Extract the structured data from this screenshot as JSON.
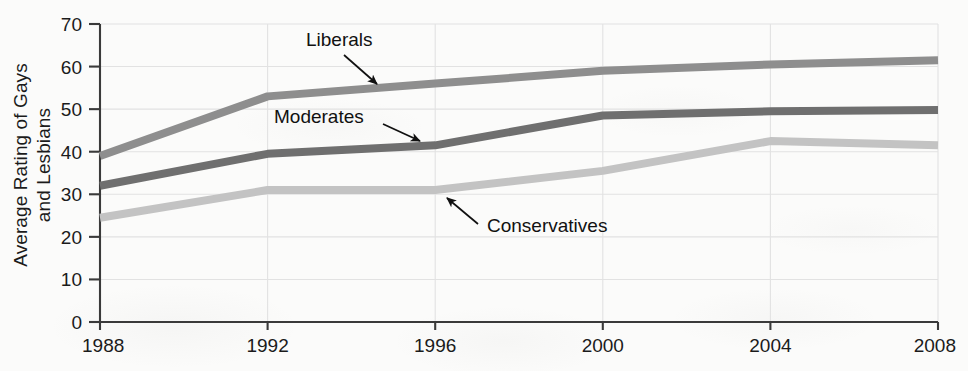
{
  "chart_data": {
    "type": "line",
    "title": "",
    "xlabel": "",
    "ylabel": "Average Rating of Gays and Lesbians",
    "ylabel_line1": "Average Rating of Gays",
    "ylabel_line2": "and Lesbians",
    "x": [
      1988,
      1992,
      1996,
      2000,
      2004,
      2008
    ],
    "categories": [
      "1988",
      "1992",
      "1996",
      "2000",
      "2004",
      "2008"
    ],
    "xlim": [
      1988,
      2008
    ],
    "ylim": [
      0,
      70
    ],
    "yticks": [
      0,
      10,
      20,
      30,
      40,
      50,
      60,
      70
    ],
    "ytick_labels": [
      "0",
      "10",
      "20",
      "30",
      "40",
      "50",
      "60",
      "70"
    ],
    "xticks": [
      1988,
      1992,
      1996,
      2000,
      2004,
      2008
    ],
    "xtick_labels": [
      "1988",
      "1992",
      "1996",
      "2000",
      "2004",
      "2008"
    ],
    "grid": true,
    "grid_axis": "both",
    "legend_position": "inline-annotations",
    "series": [
      {
        "name": "Liberals",
        "color": "#8e8e8e",
        "values": [
          39,
          53,
          56,
          59,
          60.5,
          61.5
        ]
      },
      {
        "name": "Moderates",
        "color": "#6f6f6f",
        "values": [
          32,
          39.5,
          41.5,
          48.5,
          49.5,
          49.8
        ]
      },
      {
        "name": "Conservatives",
        "color": "#c3c3c3",
        "values": [
          24.5,
          31,
          31,
          35.5,
          42.5,
          41.5
        ]
      }
    ],
    "annotations": [
      {
        "text": "Liberals",
        "series": "Liberals",
        "label_x": 306,
        "label_y": 46,
        "arrow_from_x": 344,
        "arrow_from_y": 55,
        "arrow_to_x": 377,
        "arrow_to_y": 84
      },
      {
        "text": "Moderates",
        "series": "Moderates",
        "label_x": 274,
        "label_y": 123,
        "arrow_from_x": 383,
        "arrow_from_y": 124,
        "arrow_to_x": 420,
        "arrow_to_y": 141
      },
      {
        "text": "Conservatives",
        "series": "Conservatives",
        "label_x": 487,
        "label_y": 232,
        "arrow_from_x": 478,
        "arrow_from_y": 224,
        "arrow_to_x": 447,
        "arrow_to_y": 198
      }
    ]
  },
  "axes_geometry": {
    "left": 100,
    "right": 938,
    "top": 24,
    "bottom": 322
  },
  "colors": {
    "background": "#fbfbfa",
    "axis": "#3a3a3a",
    "grid": "#e2e2e2",
    "text": "#1b1b1b"
  }
}
